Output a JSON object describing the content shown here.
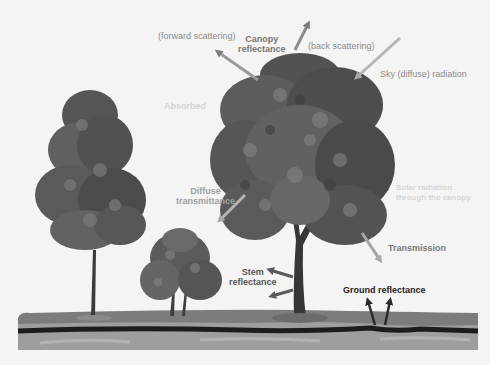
{
  "diagram": {
    "colors": {
      "background": "#f4f4f4",
      "arrow_light": "#a9a9a9",
      "arrow_mid": "#8a8a8a",
      "arrow_dark": "#2b2b2b",
      "label_light": "#8c8c8c",
      "label_dark": "#555555",
      "label_black": "#222222",
      "foliage_dark": "#4e4e4e",
      "foliage_mid": "#6d6d6d",
      "foliage_light": "#8e8e8e",
      "trunk": "#3a3a3a",
      "soil_top": "#7d7d7d",
      "soil_line": "#1e1e1e",
      "soil_bottom": "#9b9b9b"
    },
    "labels": {
      "forward_scattering": "(forward scattering)",
      "canopy_reflectance": "Canopy\nreflectance",
      "back_scattering": "(back scattering)",
      "sky_radiation": "Sky (diffuse) radiation",
      "diffuse_transmittance": "Diffuse\ntransmittance",
      "transmission": "Transmission",
      "stem_reflectance": "Stem\nreflectance",
      "ground_reflectance": "Ground reflectance",
      "ghost_absorbed": "Absorbed",
      "ghost_transmitted": "Solar radiation\nthrough the canopy"
    },
    "elements": {
      "trees": [
        "tall-narrow-tree",
        "large-broad-tree",
        "shrub"
      ],
      "ground_layers": [
        "grass-surface",
        "soil-horizon-line",
        "subsoil"
      ]
    }
  }
}
